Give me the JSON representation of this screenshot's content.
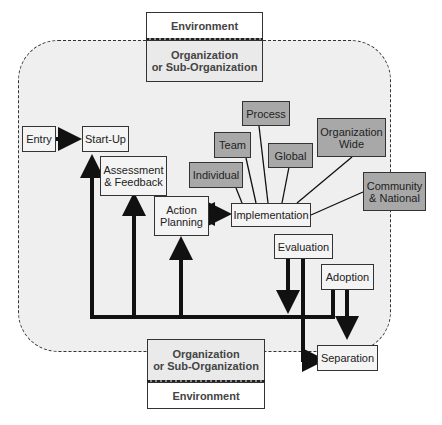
{
  "diagram": {
    "environment_top": "Environment",
    "organization_top": "Organization\nor Sub-Organization",
    "organization_bottom": "Organization\nor Sub-Organization",
    "environment_bottom": "Environment",
    "phases": {
      "entry": "Entry",
      "startup": "Start-Up",
      "assessment": "Assessment\n& Feedback",
      "action_planning": "Action\nPlanning",
      "implementation": "Implementation",
      "evaluation": "Evaluation",
      "adoption": "Adoption",
      "separation": "Separation"
    },
    "levels": {
      "individual": "Individual",
      "team": "Team",
      "process": "Process",
      "global": "Global",
      "organization_wide": "Organization\nWide",
      "community_national": "Community\n& National"
    },
    "colors": {
      "region_fill": "#efefef",
      "level_fill": "#a8a8a8",
      "phase_fill": "#f4f4f4",
      "line": "#111111"
    }
  }
}
